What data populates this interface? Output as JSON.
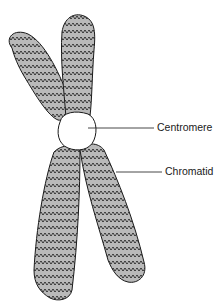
{
  "diagram": {
    "labels": {
      "centromere": "Centromere",
      "chromatid": "Chromatid"
    },
    "colors": {
      "chromatid_fill": "#b9b9b9",
      "outline": "#1a1a1a",
      "centromere_fill": "#ffffff",
      "background": "#ffffff"
    }
  }
}
